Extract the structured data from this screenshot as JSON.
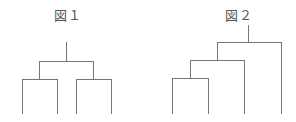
{
  "figures": [
    {
      "label": "図１",
      "description": "Dendrogram with balanced pairing: two pairs joined at root",
      "leaves": 4
    },
    {
      "label": "図２",
      "description": "Dendrogram with chained (ladder) clustering",
      "leaves": 4
    }
  ],
  "colors": {
    "line": "#777777",
    "text": "#555555"
  }
}
